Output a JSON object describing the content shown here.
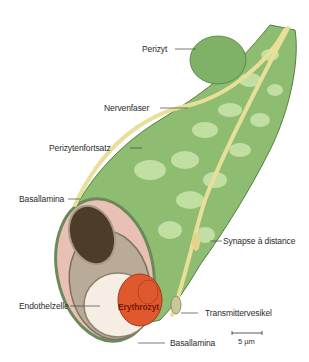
{
  "figure": {
    "colors": {
      "pericyte_dark": "#5e9a4e",
      "pericyte_light": "#b9d99a",
      "nerve": "#e6dc96",
      "basal_lamina": "#e7b9ae",
      "endothelium_nucleus": "#4a3a2a",
      "erythrocyte": "#e0582e",
      "lumen": "#f7efe6"
    }
  },
  "labels": {
    "perizyt": "Perizyt",
    "nervenfaser": "Nervenfaser",
    "perizytenfortsatz": "Perizytenfortsatz",
    "basallamina_top": "Basallamina",
    "synapse": "Synapse à distance",
    "endothelzelle": "Endothelzelle",
    "erythrozyt": "Erythrozyt",
    "transmittervesikel": "Transmittervesikel",
    "basallamina_bottom": "Basallamina"
  },
  "scale_bar": {
    "label": "5 µm"
  }
}
